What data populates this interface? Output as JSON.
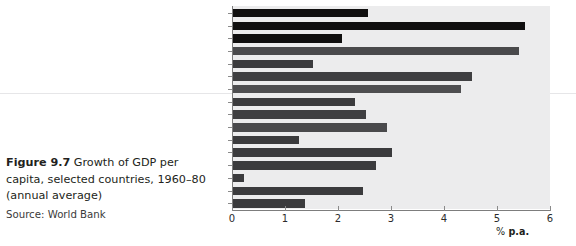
{
  "caption": {
    "figure_number": "Figure 9.7",
    "text": " Growth of GDP per capita, selected countries, 1960–80 (annual average)",
    "source": "Source: World Bank"
  },
  "axis": {
    "unit_prefix": "%",
    "unit_label": " p.a.",
    "ticks": [
      "0",
      "1",
      "2",
      "3",
      "4",
      "5",
      "6"
    ]
  },
  "colors": {
    "plot_background": "#ececed",
    "bar_dark": "#100f0f",
    "bar_gray": "#4a4a4c",
    "axis": "#7d7d7d",
    "text": "#231f20"
  },
  "chart_data": {
    "type": "bar",
    "orientation": "horizontal",
    "title": "Growth of GDP per capita, selected countries, 1960–80 (annual average)",
    "xlabel": "% p.a.",
    "ylabel": "",
    "xlim": [
      0,
      6
    ],
    "xticks": [
      0,
      1,
      2,
      3,
      4,
      5,
      6
    ],
    "grid": false,
    "legend": null,
    "source": "World Bank",
    "categories": [
      "USA",
      "Japan",
      "UK",
      "Korea",
      "Chile",
      "Brazil",
      "Malaysia",
      "South Africa",
      "Colombia",
      "China",
      "India",
      "Pakistan",
      "Kenya",
      "Nepal",
      "Malawi",
      "Burundi"
    ],
    "values": [
      2.55,
      5.5,
      2.05,
      5.4,
      1.5,
      4.5,
      4.3,
      2.3,
      2.5,
      2.9,
      1.25,
      3.0,
      2.7,
      0.2,
      2.45,
      1.35
    ],
    "bar_colors": [
      "#100f0f",
      "#100f0f",
      "#100f0f",
      "#4a4a4c",
      "#3b3b3d",
      "#3f3f41",
      "#4e4e50",
      "#3b3b3d",
      "#3f3f41",
      "#4a4a4c",
      "#3b3b3d",
      "#3b3b3d",
      "#3b3b3d",
      "#3b3b3d",
      "#3b3b3d",
      "#3b3b3d"
    ]
  }
}
